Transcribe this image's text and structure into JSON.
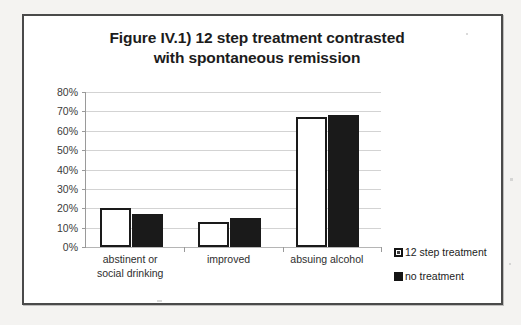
{
  "chart_data": {
    "type": "bar",
    "title": "Figure IV.1) 12 step treatment contrasted with spontaneous remission",
    "title_lines": [
      "Figure IV.1) 12 step treatment contrasted",
      "with spontaneous remission"
    ],
    "categories": [
      "abstinent or social drinking",
      "improved",
      "absuing alcohol"
    ],
    "category_lines": [
      [
        "abstinent or",
        "social drinking"
      ],
      [
        "improved"
      ],
      [
        "absuing alcohol"
      ]
    ],
    "series": [
      {
        "name": "12 step treatment",
        "values": [
          20,
          13,
          67
        ],
        "style": "white-with-black-border"
      },
      {
        "name": "no treatment",
        "values": [
          17,
          15,
          68
        ],
        "style": "solid-black"
      }
    ],
    "xlabel": "",
    "ylabel": "",
    "ylim": [
      0,
      80
    ],
    "y_tick_values": [
      0,
      10,
      20,
      30,
      40,
      50,
      60,
      70,
      80
    ],
    "y_tick_labels": [
      "0%",
      "10%",
      "20%",
      "30%",
      "40%",
      "50%",
      "60%",
      "70%",
      "80%"
    ],
    "value_format": "percent",
    "grid": true,
    "legend_position": "right",
    "colors": {
      "series_1_fill": "#ffffff",
      "series_1_border": "#1a1a1a",
      "series_2_fill": "#1a1a1a",
      "gridline": "#d3d3d3",
      "axis": "#9a9a9a",
      "text": "#1c1c1c",
      "frame_border": "#4a4a4a",
      "plot_background": "#ffffff",
      "page_background": "#f4f3f1"
    }
  },
  "legend": {
    "items": [
      {
        "label": "12 step treatment",
        "swatch": "white-square-icon"
      },
      {
        "label": "no treatment",
        "swatch": "black-square-icon"
      }
    ]
  }
}
